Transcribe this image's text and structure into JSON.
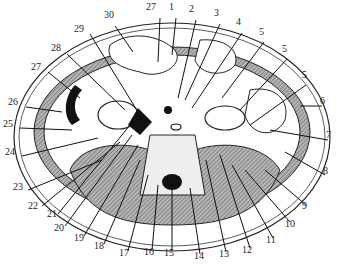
{
  "diagram": {
    "title": "",
    "type": "anatomical cross-section (abdomen, transverse)",
    "labels": [
      {
        "id": "1",
        "text": "1",
        "x": 173,
        "y": 8
      },
      {
        "id": "2",
        "text": "2",
        "x": 193,
        "y": 10
      },
      {
        "id": "3",
        "text": "3",
        "x": 218,
        "y": 14
      },
      {
        "id": "4",
        "text": "4",
        "x": 240,
        "y": 23
      },
      {
        "id": "5a",
        "text": "5",
        "x": 263,
        "y": 33
      },
      {
        "id": "5b",
        "text": "5",
        "x": 286,
        "y": 50
      },
      {
        "id": "5c",
        "text": "5",
        "x": 306,
        "y": 76
      },
      {
        "id": "6",
        "text": "6",
        "x": 324,
        "y": 102
      },
      {
        "id": "7",
        "text": "7",
        "x": 330,
        "y": 136
      },
      {
        "id": "8",
        "text": "8",
        "x": 327,
        "y": 172
      },
      {
        "id": "9",
        "text": "9",
        "x": 306,
        "y": 207
      },
      {
        "id": "10",
        "text": "10",
        "x": 289,
        "y": 225
      },
      {
        "id": "11",
        "text": "11",
        "x": 270,
        "y": 241
      },
      {
        "id": "12",
        "text": "12",
        "x": 246,
        "y": 251
      },
      {
        "id": "13",
        "text": "13",
        "x": 223,
        "y": 255
      },
      {
        "id": "14",
        "text": "14",
        "x": 198,
        "y": 257
      },
      {
        "id": "15",
        "text": "15",
        "x": 168,
        "y": 254
      },
      {
        "id": "16",
        "text": "16",
        "x": 148,
        "y": 253
      },
      {
        "id": "17",
        "text": "17",
        "x": 123,
        "y": 254
      },
      {
        "id": "18",
        "text": "18",
        "x": 98,
        "y": 247
      },
      {
        "id": "19",
        "text": "19",
        "x": 78,
        "y": 239
      },
      {
        "id": "20",
        "text": "20",
        "x": 58,
        "y": 229
      },
      {
        "id": "21",
        "text": "21",
        "x": 51,
        "y": 215
      },
      {
        "id": "22",
        "text": "22",
        "x": 32,
        "y": 207
      },
      {
        "id": "23",
        "text": "23",
        "x": 17,
        "y": 188
      },
      {
        "id": "24",
        "text": "24",
        "x": 9,
        "y": 153
      },
      {
        "id": "25",
        "text": "25",
        "x": 7,
        "y": 125
      },
      {
        "id": "26",
        "text": "26",
        "x": 12,
        "y": 103
      },
      {
        "id": "27a",
        "text": "27",
        "x": 35,
        "y": 68
      },
      {
        "id": "28",
        "text": "28",
        "x": 55,
        "y": 49
      },
      {
        "id": "29",
        "text": "29",
        "x": 78,
        "y": 30
      },
      {
        "id": "30",
        "text": "30",
        "x": 108,
        "y": 16
      },
      {
        "id": "27b",
        "text": "27",
        "x": 150,
        "y": 8
      }
    ],
    "colors": {
      "line": "#1a1a1a",
      "hatch": "#8a8a8a",
      "muscle": "#9a9a9a",
      "bg": "#ffffff"
    }
  }
}
